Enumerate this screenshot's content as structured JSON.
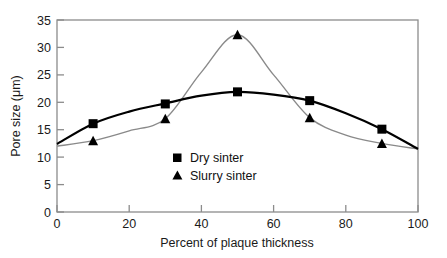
{
  "chart_data": {
    "type": "line",
    "title": "",
    "xlabel": "Percent of plaque thickness",
    "ylabel": "Pore size (μm)",
    "xlim": [
      0,
      100
    ],
    "ylim": [
      0,
      35
    ],
    "xticks": [
      "0",
      "20",
      "40",
      "60",
      "80",
      "100"
    ],
    "yticks": [
      "0",
      "5",
      "10",
      "15",
      "20",
      "25",
      "30",
      "35"
    ],
    "grid": false,
    "legend_position": "center",
    "series": [
      {
        "name": "Dry sinter",
        "marker": "square",
        "color": "#000000",
        "x": [
          10,
          30,
          50,
          70,
          90
        ],
        "values": [
          16.1,
          19.7,
          21.9,
          20.3,
          15.1
        ],
        "curve_x": [
          0,
          10,
          20,
          30,
          40,
          50,
          60,
          70,
          80,
          90,
          100
        ],
        "curve_y": [
          12.4,
          16.1,
          18.3,
          19.8,
          21.2,
          21.9,
          21.4,
          20.3,
          18.0,
          15.1,
          11.5
        ]
      },
      {
        "name": "Slurry sinter",
        "marker": "triangle",
        "color": "#000000",
        "x": [
          10,
          30,
          50,
          70,
          90
        ],
        "values": [
          13.0,
          17.0,
          32.3,
          17.2,
          12.5
        ],
        "curve_x": [
          0,
          10,
          20,
          30,
          40,
          50,
          60,
          70,
          80,
          90,
          100
        ],
        "curve_y": [
          12.0,
          13.0,
          14.8,
          17.0,
          25.5,
          32.3,
          25.0,
          17.2,
          14.0,
          12.5,
          11.5
        ]
      }
    ]
  },
  "axes": {
    "x_title": "Percent of plaque thickness",
    "y_title": "Pore size (μm)",
    "x_tick_labels": [
      "0",
      "20",
      "40",
      "60",
      "80",
      "100"
    ],
    "y_tick_labels": [
      "0",
      "5",
      "10",
      "15",
      "20",
      "25",
      "30",
      "35"
    ]
  },
  "legend": {
    "entries": [
      {
        "label": "Dry sinter",
        "marker": "square-marker-icon"
      },
      {
        "label": "Slurry sinter",
        "marker": "triangle-marker-icon"
      }
    ]
  },
  "colors": {
    "dry_sinter_line": "#000000",
    "slurry_sinter_line": "#808080",
    "axis": "#8c8c8c",
    "text": "#1a1a1a",
    "background": "#ffffff"
  }
}
